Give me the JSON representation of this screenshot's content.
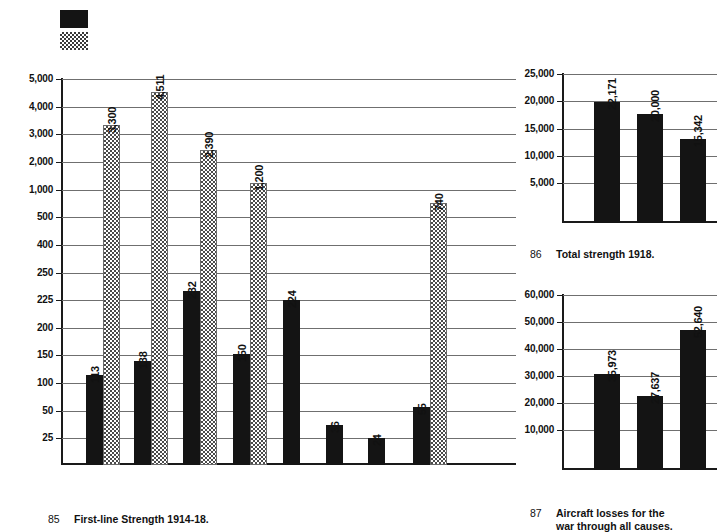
{
  "legend": {
    "swatches": [
      {
        "name": "series-a-swatch",
        "pattern": "solid",
        "color": "#141414"
      },
      {
        "name": "series-b-swatch",
        "pattern": "dotted",
        "color": "#3a3a3a"
      }
    ]
  },
  "captions": {
    "chart85": {
      "number": "85",
      "text": "First-line Strength 1914-18."
    },
    "chart86": {
      "number": "86",
      "text": "Total strength 1918."
    },
    "chart87": {
      "number": "87",
      "text": "Aircraft losses for the\nwar through all causes."
    }
  },
  "chart_data": [
    {
      "id": "chart85",
      "type": "bar",
      "title": "First-line Strength 1914-18.",
      "figure_number": "85",
      "xlabel": "",
      "ylabel": "",
      "grid": true,
      "legend": "top-left",
      "axis_scale": "custom-compressed",
      "ytick_labels": [
        "25",
        "50",
        "100",
        "150",
        "200",
        "225",
        "250",
        "400",
        "500",
        "1,000",
        "2,000",
        "3,000",
        "4,000",
        "5,000"
      ],
      "ytick_values": [
        25,
        50,
        100,
        150,
        200,
        225,
        250,
        400,
        500,
        1000,
        2000,
        3000,
        4000,
        5000
      ],
      "categories": [
        "g1",
        "g2",
        "g3",
        "g4",
        "g5",
        "g6",
        "g7",
        "g8"
      ],
      "series": [
        {
          "name": "1914",
          "pattern": "solid",
          "values": [
            113,
            138,
            232,
            150,
            224,
            36,
            24,
            55
          ],
          "labels": [
            "113",
            "138",
            "232",
            "150",
            "224",
            "36",
            "24",
            "55"
          ]
        },
        {
          "name": "1918",
          "pattern": "dotted",
          "values": [
            3300,
            4511,
            2390,
            1200,
            null,
            null,
            null,
            740
          ],
          "labels": [
            "3,300",
            "4,511",
            "2,390",
            "1,200",
            "",
            "",
            "",
            "740"
          ]
        }
      ]
    },
    {
      "id": "chart86",
      "type": "bar",
      "title": "Total strength 1918.",
      "figure_number": "86",
      "xlabel": "",
      "ylabel": "",
      "grid": true,
      "ylim": [
        0,
        27500
      ],
      "ytick_labels": [
        "5,000",
        "10,000",
        "15,000",
        "20,000",
        "25,000"
      ],
      "ytick_values": [
        5000,
        10000,
        15000,
        20000,
        25000
      ],
      "categories": [
        "b1",
        "b2",
        "b3"
      ],
      "values": [
        22171,
        20000,
        15342
      ],
      "labels": [
        "22,171",
        "20,000",
        "15,342"
      ],
      "pattern": "solid"
    },
    {
      "id": "chart87",
      "type": "bar",
      "title": "Aircraft losses for the war through all causes.",
      "figure_number": "87",
      "xlabel": "",
      "ylabel": "",
      "grid": true,
      "ylim": [
        0,
        66000
      ],
      "ytick_labels": [
        "10,000",
        "20,000",
        "30,000",
        "40,000",
        "50,000",
        "60,000"
      ],
      "ytick_values": [
        10000,
        20000,
        30000,
        40000,
        50000,
        60000
      ],
      "categories": [
        "c1",
        "c2",
        "c3"
      ],
      "values": [
        35973,
        27637,
        52640
      ],
      "labels": [
        "35,973",
        "27,637",
        "52,640"
      ],
      "pattern": "solid"
    }
  ]
}
